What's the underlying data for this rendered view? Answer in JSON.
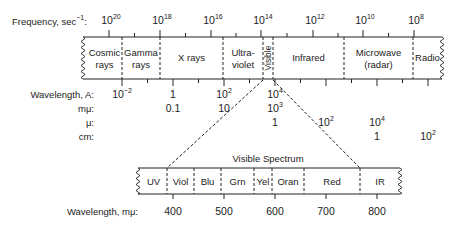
{
  "top_scale": {
    "frequency_label": "Frequency, sec",
    "frequency_label_exp": "−1",
    "frequency_label_colon": ":",
    "frequency_ticks": [
      {
        "base": "10",
        "exp": "20",
        "x": 109
      },
      {
        "base": "10",
        "exp": "18",
        "x": 160
      },
      {
        "base": "10",
        "exp": "16",
        "x": 211
      },
      {
        "base": "10",
        "exp": "14",
        "x": 261
      },
      {
        "base": "10",
        "exp": "12",
        "x": 313
      },
      {
        "base": "10",
        "exp": "10",
        "x": 363
      },
      {
        "base": "10",
        "exp": "8",
        "x": 414
      }
    ],
    "bands": [
      {
        "line1": "Cosmic",
        "line2": "rays",
        "x0": 83,
        "x1": 122
      },
      {
        "line1": "Gamma",
        "line2": "rays",
        "x0": 122,
        "x1": 160
      },
      {
        "line1": "X rays",
        "line2": "",
        "x0": 160,
        "x1": 223
      },
      {
        "line1": "Ultra-",
        "line2": "violet",
        "x0": 223,
        "x1": 263
      },
      {
        "line1": "Visible",
        "line2": "",
        "x0": 263,
        "x1": 273,
        "vertical": true
      },
      {
        "line1": "Infrared",
        "line2": "",
        "x0": 273,
        "x1": 344
      },
      {
        "line1": "Microwave",
        "line2": "(radar)",
        "x0": 344,
        "x1": 413
      },
      {
        "line1": "Radio",
        "line2": "",
        "x0": 413,
        "x1": 442
      }
    ]
  },
  "wavelength_rows": [
    {
      "label": "Wavelength, A:",
      "values": [
        {
          "base": "10",
          "exp": "−2",
          "x": 122
        },
        {
          "base": "1",
          "exp": "",
          "x": 173
        },
        {
          "base": "10",
          "exp": "2",
          "x": 224
        },
        {
          "base": "10",
          "exp": "4",
          "x": 275
        }
      ]
    },
    {
      "label": "mμ:",
      "values": [
        {
          "base": "0.1",
          "exp": "",
          "x": 173
        },
        {
          "base": "10",
          "exp": "",
          "x": 224
        },
        {
          "base": "10",
          "exp": "3",
          "x": 275
        }
      ]
    },
    {
      "label": "μ:",
      "values": [
        {
          "base": "1",
          "exp": "",
          "x": 275
        },
        {
          "base": "10",
          "exp": "2",
          "x": 326
        },
        {
          "base": "10",
          "exp": "4",
          "x": 377
        }
      ]
    },
    {
      "label": "cm:",
      "values": [
        {
          "base": "1",
          "exp": "",
          "x": 377
        },
        {
          "base": "10",
          "exp": "2",
          "x": 428
        }
      ]
    }
  ],
  "visible_spectrum": {
    "title": "Visible Spectrum",
    "bands": [
      {
        "label": "UV",
        "x0": 138,
        "x1": 167
      },
      {
        "label": "Viol",
        "x0": 167,
        "x1": 194
      },
      {
        "label": "Blu",
        "x0": 194,
        "x1": 221
      },
      {
        "label": "Grn",
        "x0": 221,
        "x1": 254
      },
      {
        "label": "Yel",
        "x0": 254,
        "x1": 272
      },
      {
        "label": "Oran",
        "x0": 272,
        "x1": 304
      },
      {
        "label": "Red",
        "x0": 304,
        "x1": 360
      },
      {
        "label": "IR",
        "x0": 360,
        "x1": 400
      }
    ],
    "axis_label": "Wavelength, mμ:",
    "ticks": [
      {
        "label": "400",
        "x": 173
      },
      {
        "label": "500",
        "x": 224
      },
      {
        "label": "600",
        "x": 275
      },
      {
        "label": "700",
        "x": 326
      },
      {
        "label": "800",
        "x": 377
      }
    ]
  },
  "colors": {
    "ink": "#222222",
    "background": "#ffffff"
  }
}
